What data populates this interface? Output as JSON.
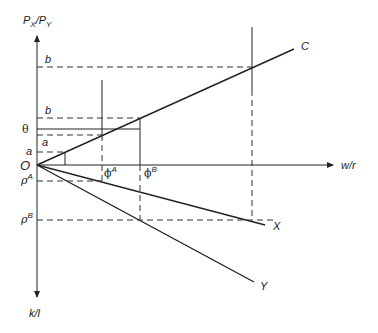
{
  "diagram": {
    "axes": {
      "vertical_up_label": "P",
      "vertical_up_sub1": "X",
      "vertical_up_slash": "/",
      "vertical_up_sub2": "Y",
      "vertical_up_base2": "P",
      "vertical_down_label": "k/l",
      "horizontal_label": "w/r",
      "origin_label": "O"
    },
    "rays": {
      "C": "C",
      "X": "X",
      "Y": "Y"
    },
    "left_labels": {
      "b_top": "b",
      "b_mid": "b",
      "theta": "θ",
      "a_upper": "a",
      "a_lower": "a",
      "rho_A": "ρ",
      "rho_A_sup": "A",
      "rho_B": "ρ",
      "rho_B_sup": "B"
    },
    "axis_labels": {
      "phi_A": "ϕ",
      "phi_A_sup": "A",
      "phi_B": "ϕ",
      "phi_B_sup": "B"
    }
  }
}
